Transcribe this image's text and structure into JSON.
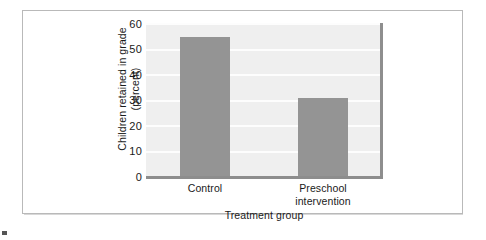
{
  "chart_data": {
    "type": "bar",
    "title": "",
    "categories": [
      "Control",
      "Preschool intervention"
    ],
    "category_lines": [
      [
        "Control"
      ],
      [
        "Preschool",
        "intervention"
      ]
    ],
    "values": [
      55,
      31
    ],
    "xlabel": "Treatment group",
    "ylabel": "Children retained in grade (percent)",
    "ylabel_lines": [
      "Children retained in grade",
      "(percent)"
    ],
    "ylim": [
      0,
      60
    ],
    "ytick_labels": [
      "0",
      "10",
      "20",
      "30",
      "40",
      "50",
      "60"
    ],
    "ytick_values": [
      0,
      10,
      20,
      30,
      40,
      50,
      60
    ],
    "grid": true,
    "legend": "none",
    "colors": {
      "bar_fill": "#949494",
      "plot_background": "#efefef",
      "gridline": "#fdfdfd",
      "axis_line": "#8d8d8d",
      "frame_border": "#b9b9b9",
      "text": "#1a1a1a",
      "page_background": "#ffffff"
    }
  }
}
